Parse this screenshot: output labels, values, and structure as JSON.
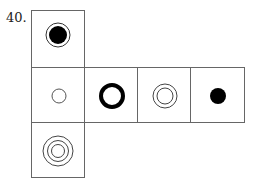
{
  "problem": {
    "number": "40.",
    "description": "Cube net with six faces showing circle patterns",
    "faces": [
      {
        "id": "top",
        "pattern": "filled circle with outer ring"
      },
      {
        "id": "left",
        "pattern": "small thin circle"
      },
      {
        "id": "center",
        "pattern": "thick bold ring"
      },
      {
        "id": "center-right",
        "pattern": "double concentric circles"
      },
      {
        "id": "right",
        "pattern": "small filled dot"
      },
      {
        "id": "bottom",
        "pattern": "triple concentric circles"
      }
    ],
    "colors": {
      "line": "#666666",
      "ink": "#000000"
    }
  }
}
